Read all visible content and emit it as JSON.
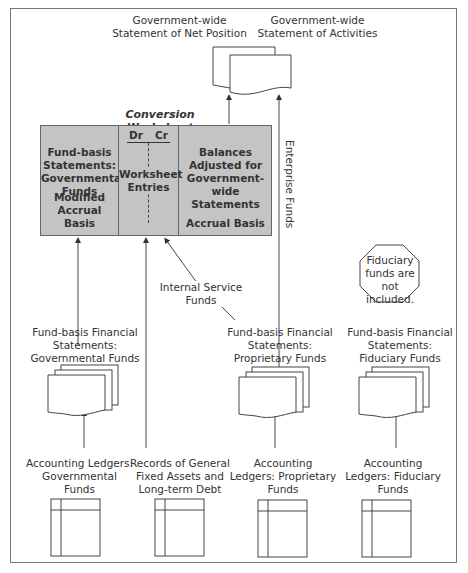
{
  "top": {
    "net_position": "Government-wide\nStatement of Net Position",
    "activities": "Government-wide\nStatement of Activities"
  },
  "worksheet": {
    "title": "Conversion Worksheet",
    "col1_top": "Fund-basis\nStatements:\nGovernmental\nFunds",
    "col1_bottom": "Modified\nAccrual Basis",
    "dr": "Dr",
    "cr": "Cr",
    "col2_top": "Worksheet\nEntries",
    "col3_top": "Balances\nAdjusted for\nGovernment-wide\nStatements",
    "col3_bottom": "Accrual Basis"
  },
  "flows": {
    "enterprise_funds": "Enterprise Funds",
    "internal_service_funds": "Internal Service\nFunds"
  },
  "note": {
    "fiduciary": "Fiduciary\nfunds are\nnot included."
  },
  "statements": {
    "governmental": "Fund-basis Financial\nStatements:\nGovernmental Funds",
    "proprietary": "Fund-basis Financial\nStatements:\nProprietary Funds",
    "fiduciary": "Fund-basis Financial\nStatements:\nFiduciary Funds"
  },
  "ledgers": {
    "governmental": "Accounting Ledgers:\nGovernmental\nFunds",
    "general_fixed": "Records of General\nFixed Assets and\nLong-term Debt",
    "proprietary": "Accounting\nLedgers: Proprietary\nFunds",
    "fiduciary": "Accounting\nLedgers: Fiduciary\nFunds"
  },
  "colors": {
    "worksheet_fill": "#c4c4c4",
    "line": "#444444",
    "frame": "#777777"
  }
}
